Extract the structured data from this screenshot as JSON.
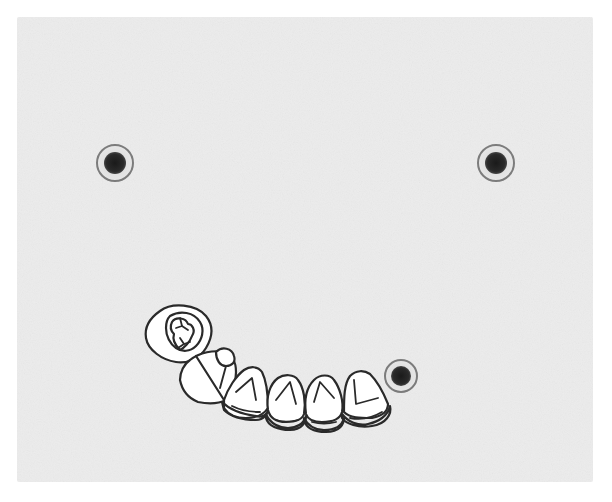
{
  "diagram": {
    "type": "dental-arch-line-drawing",
    "background_color": "#ececec",
    "outer_color": "#ffffff",
    "line_color": "#2a2a2a",
    "panel": {
      "x": 17,
      "y": 17,
      "width": 576,
      "height": 465
    }
  },
  "markers": [
    {
      "name": "fiducial-marker-top-left",
      "cx": 115,
      "cy": 163,
      "r": 18
    },
    {
      "name": "fiducial-marker-top-right",
      "cx": 496,
      "cy": 163,
      "r": 18
    },
    {
      "name": "fiducial-marker-bottom-right",
      "cx": 401,
      "cy": 376,
      "r": 16
    }
  ],
  "teeth": [
    {
      "name": "molar",
      "position": 1
    },
    {
      "name": "premolar",
      "position": 2
    },
    {
      "name": "tooth-3",
      "position": 3
    },
    {
      "name": "tooth-4",
      "position": 4
    },
    {
      "name": "tooth-5",
      "position": 5
    },
    {
      "name": "tooth-6",
      "position": 6
    }
  ]
}
